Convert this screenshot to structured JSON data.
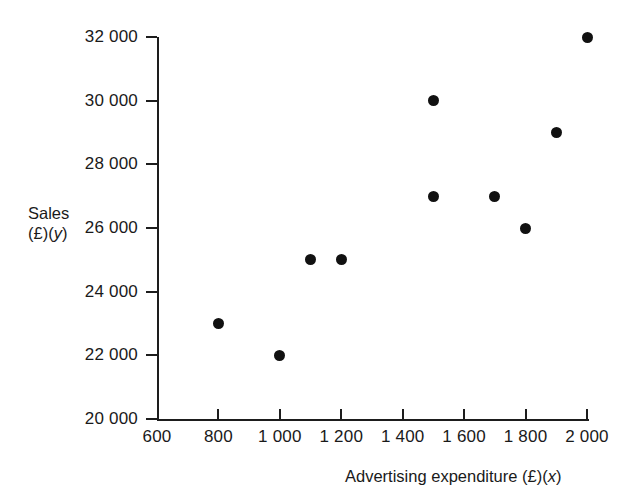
{
  "chart_data": {
    "type": "scatter",
    "title": "",
    "xlabel": "Advertising expenditure (£)(x)",
    "ylabel": "Sales (£)(y)",
    "xlabel_text": "Advertising expenditure (£)",
    "xlabel_var": "x",
    "ylabel_text": "Sales (£)",
    "ylabel_var": "y",
    "ylabel_line1": "Sales",
    "xlim": [
      600,
      2000
    ],
    "ylim": [
      20000,
      32000
    ],
    "grid": false,
    "legend": false,
    "x_ticks": [
      600,
      800,
      1000,
      1200,
      1400,
      1600,
      1800,
      2000
    ],
    "y_ticks": [
      20000,
      22000,
      24000,
      26000,
      28000,
      30000,
      32000
    ],
    "x_tick_labels": [
      "600",
      "800",
      "1 000",
      "1 200",
      "1 400",
      "1 600",
      "1 800",
      "2 000"
    ],
    "y_tick_labels": [
      "20 000",
      "22 000",
      "24 000",
      "26 000",
      "28 000",
      "30 000",
      "32 000"
    ],
    "marker": "filled-circle",
    "marker_color": "#111111",
    "axis_color": "#1d1d1d",
    "background_color": "#ffffff",
    "points": [
      {
        "x": 800,
        "y": 23000
      },
      {
        "x": 1000,
        "y": 22000
      },
      {
        "x": 1100,
        "y": 25000
      },
      {
        "x": 1200,
        "y": 25000
      },
      {
        "x": 1500,
        "y": 30000
      },
      {
        "x": 1500,
        "y": 27000
      },
      {
        "x": 1700,
        "y": 27000
      },
      {
        "x": 1800,
        "y": 26000
      },
      {
        "x": 1900,
        "y": 29000
      },
      {
        "x": 2000,
        "y": 32000
      }
    ]
  }
}
